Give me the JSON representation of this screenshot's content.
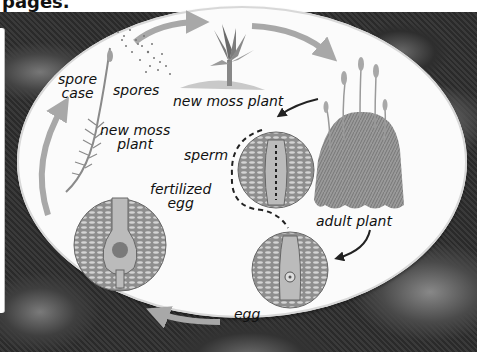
{
  "header": {
    "partial_text": "pages."
  },
  "diagram": {
    "style": "grayscale textbook illustration on white oval over moss-covered rock photograph",
    "colors": {
      "oval_fill": "#fbfbfb",
      "cycle_arrow": "#a8a8a8",
      "pointer_arrow": "#222222",
      "cell_circle": "#8a8a8a",
      "label_text": "#111111"
    },
    "labels": {
      "spore_case": "spore\ncase",
      "spore_case_line1": "spore",
      "spore_case_line2": "case",
      "spores": "spores",
      "new_moss_plant_top": "new moss plant",
      "new_moss_plant_left_line1": "new moss",
      "new_moss_plant_left_line2": "plant",
      "sperm": "sperm",
      "fertilized_egg_line1": "fertilized",
      "fertilized_egg_line2": "egg",
      "adult_plant": "adult plant",
      "egg": "egg"
    },
    "stages": [
      {
        "id": "spores",
        "label": "spores"
      },
      {
        "id": "new-moss-plant-sprout",
        "label": "new moss plant"
      },
      {
        "id": "adult-plant",
        "label": "adult plant"
      },
      {
        "id": "sperm",
        "label": "sperm"
      },
      {
        "id": "egg",
        "label": "egg"
      },
      {
        "id": "fertilized-egg",
        "label": "fertilized egg"
      },
      {
        "id": "new-moss-plant-with-spore-case",
        "label": "new moss plant"
      },
      {
        "id": "spore-case",
        "label": "spore case"
      }
    ],
    "flow": [
      "spores -> new moss plant",
      "new moss plant -> adult plant",
      "adult plant -> sperm",
      "adult plant -> egg",
      "sperm -> egg",
      "egg -> fertilized egg",
      "fertilized egg -> new moss plant",
      "new moss plant -> spore case",
      "spore case -> spores"
    ]
  }
}
